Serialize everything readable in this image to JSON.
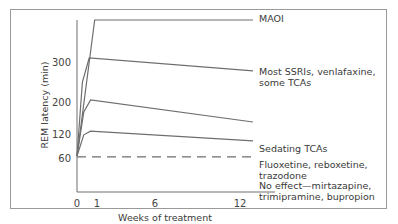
{
  "chart_data": {
    "type": "line",
    "title": "",
    "xlabel": "Weeks of treatment",
    "ylabel": "REM latency (min)",
    "xlim": [
      0,
      12.8
    ],
    "ylim": [
      60,
      405
    ],
    "x_ticks": [
      0,
      1,
      6,
      12
    ],
    "x_tick_labels": [
      "0",
      "1",
      "6",
      "12"
    ],
    "y_ticks": [
      60,
      120,
      200,
      300
    ],
    "y_tick_labels": [
      "60",
      "120",
      "200",
      "300"
    ],
    "grid": false,
    "legend": "direct labels at right",
    "colors": {
      "line": "#6e6e6e",
      "axis": "#6e6e6e",
      "frame": "#9a9a9a",
      "text": "#3a3a3a"
    },
    "series": [
      {
        "name": "MAOI",
        "label_lines": [
          "MAOI"
        ],
        "style": "solid",
        "x": [
          0,
          1.3,
          12.8
        ],
        "y": [
          65,
          405,
          405
        ]
      },
      {
        "name": "Most SSRIs, venlafaxine, some TCAs",
        "label_lines": [
          "Most SSRIs, venlafaxine,",
          "some TCAs"
        ],
        "style": "solid",
        "x": [
          0,
          0.4,
          0.9,
          12.8
        ],
        "y": [
          65,
          250,
          310,
          278
        ]
      },
      {
        "name": "Sedating TCAs",
        "label_lines": [
          "Sedating TCAs"
        ],
        "style": "solid",
        "x": [
          0,
          0.5,
          1.0,
          12.8
        ],
        "y": [
          65,
          175,
          205,
          150
        ]
      },
      {
        "name": "Fluoxetine, reboxetine, trazodone",
        "label_lines": [
          "Fluoxetine, reboxetine,",
          "trazodone"
        ],
        "style": "solid",
        "x": [
          0,
          0.5,
          1.0,
          12.8
        ],
        "y": [
          65,
          118,
          127,
          103
        ]
      },
      {
        "name": "No effect—mirtazapine, trimipramine, bupropion",
        "label_lines": [
          "No effect—mirtazapine,",
          "trimipramine, bupropion"
        ],
        "style": "dashed",
        "x": [
          0,
          12.8
        ],
        "y": [
          63,
          63
        ]
      }
    ]
  }
}
